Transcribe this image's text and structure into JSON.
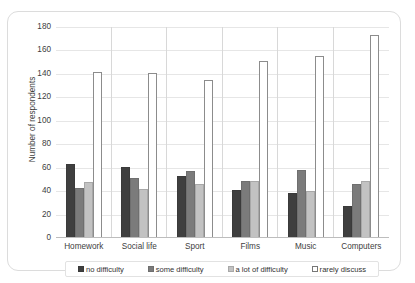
{
  "chart_data": {
    "type": "bar",
    "title": "",
    "xlabel": "",
    "ylabel": "Number of respondents",
    "ylim": [
      0,
      180
    ],
    "ytick_step": 20,
    "yticks": [
      180,
      160,
      140,
      120,
      100,
      80,
      60,
      40,
      20,
      0
    ],
    "grid": true,
    "legend_position": "bottom",
    "categories": [
      "Homework",
      "Social life",
      "Sport",
      "Films",
      "Music",
      "Computers"
    ],
    "series": [
      {
        "name": "no difficulty",
        "color": "#3f3f3f",
        "values": [
          63,
          61,
          53,
          41,
          38,
          27
        ]
      },
      {
        "name": "some difficulty",
        "color": "#7b7b7b",
        "values": [
          43,
          51,
          57,
          49,
          58,
          46
        ]
      },
      {
        "name": "a lot of difficulty",
        "color": "#c2c2c2",
        "values": [
          48,
          42,
          46,
          49,
          40,
          49
        ]
      },
      {
        "name": "rarely discuss",
        "color": "#ffffff",
        "values": [
          142,
          141,
          135,
          151,
          155,
          173
        ]
      }
    ]
  },
  "legend": {
    "items": [
      {
        "label": "no difficulty"
      },
      {
        "label": "some difficulty"
      },
      {
        "label": "a lot of difficulty"
      },
      {
        "label": "rarely discuss"
      }
    ]
  }
}
